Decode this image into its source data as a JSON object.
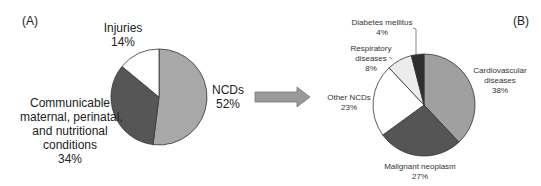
{
  "chart_data": [
    {
      "type": "pie",
      "panel": "(A)",
      "title": "",
      "slices": [
        {
          "label": "NCDs",
          "value": 52,
          "color": "#a8a8a8"
        },
        {
          "label": "Communicable maternal, perinatal, and nutritional conditions",
          "value": 34,
          "color": "#565656"
        },
        {
          "label": "Injuries",
          "value": 14,
          "color": "#ffffff"
        }
      ]
    },
    {
      "type": "pie",
      "panel": "(B)",
      "title": "",
      "slices": [
        {
          "label": "Cardiovascular diseases",
          "value": 38,
          "color": "#a0a0a0"
        },
        {
          "label": "Malignant neoplasm",
          "value": 27,
          "color": "#555555"
        },
        {
          "label": "Other NCDs",
          "value": 23,
          "color": "#ffffff"
        },
        {
          "label": "Respiratory diseases",
          "value": 8,
          "color": "#ececec"
        },
        {
          "label": "Diabetes mellitus",
          "value": 4,
          "color": "#2f2f2f"
        }
      ]
    }
  ],
  "labels": {
    "panel_a": "(A)",
    "panel_b": "(B)",
    "injuries": [
      "Injuries",
      "14%"
    ],
    "ncds": [
      "NCDs",
      "52%"
    ],
    "communicable": [
      "Communicable",
      "maternal, perinatal,",
      "and nutritional",
      "conditions",
      "34%"
    ],
    "diabetes": [
      "Diabetes mellitus",
      "4%"
    ],
    "respiratory": [
      "Respiratory",
      "diseases",
      "8%"
    ],
    "cardio": [
      "Cardiovascular",
      "diseases",
      "38%"
    ],
    "other": [
      "Other NCDs",
      "23%"
    ],
    "malignant": [
      "Malignant neoplasm",
      "27%"
    ]
  },
  "arrow": {
    "direction": "right",
    "color": "#999999"
  }
}
